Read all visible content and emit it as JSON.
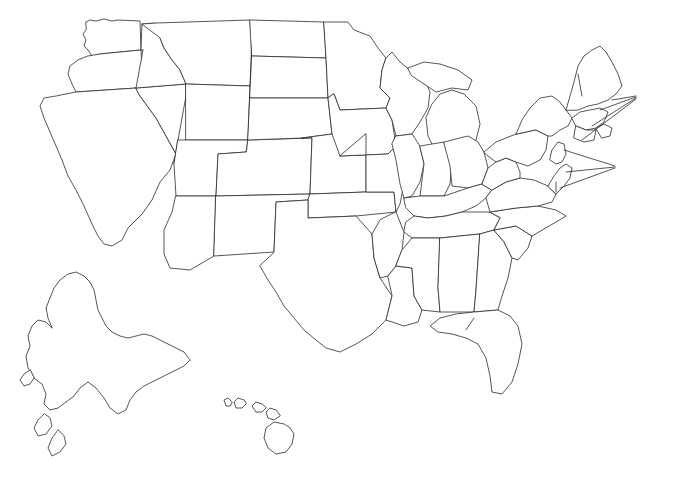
{
  "map": {
    "type": "choropleth-annotated-us-map",
    "background_color": "#ffffff",
    "outline_color": "#2b2b2b",
    "text_color": "#1a1a1a",
    "hazard_codes": [
      "Av",
      "Co",
      "Eq",
      "Fl",
      "Hu",
      "Lb",
      "Ls",
      "So",
      "Su",
      "Ts",
      "Vo"
    ]
  },
  "states": [
    {
      "id": "washington",
      "label": "Av, Co,\nEq, Fl, Ls,\nTs, Vo, Su",
      "x": 86,
      "y": 26,
      "align": "center"
    },
    {
      "id": "oregon",
      "label": "Av, Co,\nEq, Fl, Ls,\nTs, Vo, Su",
      "x": 42,
      "y": 82,
      "align": "center"
    },
    {
      "id": "idaho",
      "label": "Av, Eq,\nFl, Ls, Vo,\nSu",
      "x": 127,
      "y": 104,
      "align": "center"
    },
    {
      "id": "montana",
      "label": "Av, Eq,\nFl, Ls, Vo, So,\nSu",
      "x": 170,
      "y": 52,
      "align": "center"
    },
    {
      "id": "north-dakota",
      "label": "Fl, Ls, So,\nSu",
      "x": 272,
      "y": 66,
      "align": "center"
    },
    {
      "id": "south-dakota",
      "label": "Fl, Ls, So, Su",
      "x": 265,
      "y": 118,
      "align": "center"
    },
    {
      "id": "nebraska",
      "label": "Fl, Ls, So, Su",
      "x": 265,
      "y": 157,
      "align": "center"
    },
    {
      "id": "kansas",
      "label": "Fl, Ls, So, Su",
      "x": 282,
      "y": 212,
      "align": "center"
    },
    {
      "id": "minnesota",
      "label": "Co, Fl,\nLs, So,\nSu",
      "x": 345,
      "y": 76,
      "align": "center"
    },
    {
      "id": "wisconsin",
      "label": "Fl, Ls,\nCo, Su",
      "x": 394,
      "y": 106,
      "align": "center"
    },
    {
      "id": "michigan",
      "label": "Co,\nFl, Ls,\nSu",
      "x": 462,
      "y": 120,
      "align": "center"
    },
    {
      "id": "iowa",
      "label": "Fl, Lb, So,\nSu",
      "x": 352,
      "y": 157,
      "align": "center"
    },
    {
      "id": "missouri",
      "label": "Eq, Fl,\nLs, So,\nSu",
      "x": 372,
      "y": 205,
      "align": "center"
    },
    {
      "id": "illinois",
      "label": "Co,\nEq,\nFl, Ls,\nSu",
      "x": 415,
      "y": 160,
      "align": "center"
    },
    {
      "id": "indiana",
      "label": "Co,\nFl,\nLs,\nSu",
      "x": 452,
      "y": 160,
      "align": "center"
    },
    {
      "id": "ohio",
      "label": "Co,\nFl, Ls,\nSu",
      "x": 484,
      "y": 158,
      "align": "center"
    },
    {
      "id": "wyoming",
      "label": "Av, Eq,\nFl, Ls, Vo,\nSo, Su",
      "x": 145,
      "y": 163,
      "align": "center"
    },
    {
      "id": "nevada",
      "label": "Av, Eq,\nFl, Ls, Vo",
      "x": 88,
      "y": 157,
      "align": "center"
    },
    {
      "id": "california",
      "label": "Av, Co,\nEq, Fl,\nLs, Su,\nTs, Vo,\nSo",
      "x": 38,
      "y": 183,
      "align": "center"
    },
    {
      "id": "utah",
      "label": "Av, Eq,\nFl, Ls, So,\nSu, Vo",
      "x": 130,
      "y": 247,
      "align": "center"
    },
    {
      "id": "arizona",
      "label": "Av, Eq,\nFl, Ls, So,\nSu, Vo",
      "x": 130,
      "y": 247,
      "align": "center",
      "dup": true
    },
    {
      "id": "colorado",
      "label": "Av, Eq,\nFl, Ls, So,\nSu",
      "x": 211,
      "y": 183,
      "align": "center"
    },
    {
      "id": "new-mexico",
      "label": "Av, Eq,\nFl, Ls, Vo,\nSo, Su",
      "x": 199,
      "y": 255,
      "align": "center"
    },
    {
      "id": "oklahoma",
      "label": "Fl, Ls,\nSo, Su",
      "x": 316,
      "y": 253,
      "align": "center"
    },
    {
      "id": "texas",
      "label": "Co, Fl, Hu,\nLs, Su, So",
      "x": 287,
      "y": 315,
      "align": "center"
    },
    {
      "id": "arkansas",
      "label": "Eq, So,\nFl, Ls,\nSu",
      "x": 374,
      "y": 258,
      "align": "center"
    },
    {
      "id": "louisiana",
      "label": "Co,\nFl,\nHu,\nSu,\nLs,\nSo",
      "x": 378,
      "y": 306,
      "align": "center"
    },
    {
      "id": "mississippi",
      "label": "Co,\nFl, Hu,\nSu, Ls,\nSo",
      "x": 422,
      "y": 270,
      "align": "center"
    },
    {
      "id": "alabama",
      "label": "Co,\nFl, Hu,\nSu, Ls,\nSo",
      "x": 460,
      "y": 270,
      "align": "center"
    },
    {
      "id": "tennessee",
      "label": "Fl, Ls, So,\nSu",
      "x": 448,
      "y": 233,
      "align": "center"
    },
    {
      "id": "kentucky",
      "label": "Eq, Fl,\nLs, Su",
      "x": 462,
      "y": 207,
      "align": "center"
    },
    {
      "id": "west-virginia",
      "label": "Fl,\nSu\nLs\nSu",
      "x": 502,
      "y": 190,
      "align": "center"
    },
    {
      "id": "virginia",
      "label": "Co, Fl,\nHu, Ls,",
      "x": 520,
      "y": 203,
      "align": "center"
    },
    {
      "id": "north-carolina",
      "label": "Co, Fl, Hu\nLs, Su",
      "x": 524,
      "y": 236,
      "align": "center"
    },
    {
      "id": "south-carolina",
      "label": "Co, Eq,\nFl, Hu,\nLs, So,\nSu",
      "x": 508,
      "y": 255,
      "align": "center"
    },
    {
      "id": "georgia",
      "label": "Co, Fl,\nHu, Su,\nLs, So",
      "x": 483,
      "y": 262,
      "align": "center"
    },
    {
      "id": "florida",
      "label": "Co,\nFl,\nHu,\nSu,\nSo",
      "x": 487,
      "y": 333,
      "align": "center"
    },
    {
      "id": "pennsylvania",
      "label": "Co, Fl,\nLs, Su",
      "x": 525,
      "y": 148,
      "align": "center"
    },
    {
      "id": "new-york",
      "label": "Co,\nEq, Fl,\nHu, Ls, Su",
      "x": 525,
      "y": 103,
      "align": "center"
    },
    {
      "id": "vermont",
      "label": "Ls",
      "x": 572,
      "y": 62,
      "align": "center"
    },
    {
      "id": "new-england",
      "label": "Co,\nEq,\nFl,\nHu,\nLs",
      "x": 643,
      "y": 100,
      "align": "left"
    },
    {
      "id": "mid-atlantic",
      "label": "Co,\nFl,\nHu,\nLs,\nSu",
      "x": 620,
      "y": 170,
      "align": "left"
    },
    {
      "id": "maryland-su",
      "label": "Su",
      "x": 552,
      "y": 182,
      "align": "center"
    },
    {
      "id": "alaska",
      "label": "Av, Co,\nEq, Fl,\nLs, Ts,\nVo, Su",
      "x": 57,
      "y": 340,
      "align": "left"
    },
    {
      "id": "hawaii",
      "label": "Co, Eq,\nFl, Hu, Ls,\nTs, Vo",
      "x": 237,
      "y": 417,
      "align": "left"
    }
  ],
  "state_labels_text": {
    "washington": "Av, Co, Eq, Fl, Ls, Ts, Vo, Su",
    "oregon": "Av, Co, Eq, Fl, Ls, Ts, Vo, Su",
    "idaho": "Av, Eq, Fl, Ls, Vo, Su",
    "montana": "Av, Eq, Fl, Ls, Vo, So, Su",
    "north_dakota": "Fl, Ls, So, Su",
    "south_dakota": "Fl, Ls, So, Su",
    "nebraska": "Fl, Ls, So, Su",
    "kansas": "Fl, Ls, So, Su",
    "minnesota": "Co, Fl, Ls, So, Su",
    "wisconsin": "Fl, Ls, Co, Su",
    "michigan": "Co, Fl, Ls, Su",
    "iowa": "Fl, Lb, So, Su",
    "missouri": "Eq, Fl, Ls, So, Su",
    "illinois": "Co, Eq, Fl, Ls, Su",
    "indiana": "Co, Fl, Ls, Su",
    "ohio": "Co, Fl, Ls, Su",
    "wyoming": "Av, Eq, Fl, Ls, Vo, So, Su",
    "nevada": "Av, Eq, Fl, Ls, Vo",
    "california": "Av, Co, Eq, Fl, Ls, Su, Ts, Vo, So",
    "utah": "Av, Eq, Fl, Ls, Vo, So, Su",
    "arizona": "Av, Eq, Fl, Ls, So, Su, Vo",
    "colorado": "Av, Eq, Fl, Ls, So, Su",
    "new_mexico": "Av, Eq, Fl, Ls, Vo, So, Su",
    "oklahoma": "Fl, Ls, So, Su",
    "texas": "Co, Fl, Hu, Ls, Su, So",
    "arkansas": "Eq, So, Fl, Ls, Su",
    "louisiana": "Co, Fl, Hu, Su, Ls, So",
    "mississippi": "Co, Fl, Hu, Su, Ls, So",
    "alabama": "Co, Fl, Hu, Su, Ls, So",
    "tennessee": "Fl, Ls, So, Su",
    "kentucky": "Eq, Fl, Ls, Su",
    "west_virginia": "Fl, Ls, Su",
    "virginia": "Co, Fl, Hu, Ls",
    "north_carolina": "Co, Fl, Hu, Ls, Su",
    "south_carolina": "Co, Eq, Fl, Hu, Ls, So, Su",
    "georgia": "Co, Fl, Hu, Su, Ls, So",
    "florida": "Co, Fl, Hu, Su, So",
    "pennsylvania": "Co, Fl, Ls, Su",
    "new_york": "Co, Eq, Fl, Hu, Ls, Su",
    "vermont": "Ls",
    "new_england": "Co, Eq, Fl, Hu, Ls",
    "mid_atlantic": "Co, Fl, Hu, Ls, Su",
    "maryland": "Su",
    "alaska": "Av, Co, Eq, Fl, Ls, Ts, Vo, Su",
    "hawaii": "Co, Eq, Fl, Hu, Ls, Ts, Vo"
  }
}
